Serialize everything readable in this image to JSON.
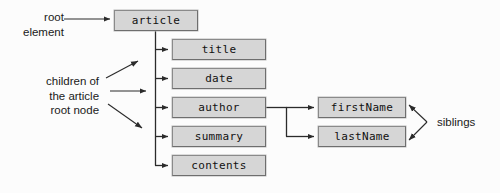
{
  "diagram": {
    "background_color": "#fcfcfc",
    "node_fill_color": "#d6d6d6",
    "node_border_color": "#8a8a8a",
    "connector_color": "#2b2b2b",
    "text_color": "#111111"
  },
  "nodes": {
    "root": {
      "label": "article",
      "x": 114,
      "y": 10,
      "width": 84,
      "height": 21
    },
    "children": [
      {
        "label": "title",
        "x": 172,
        "y": 39,
        "width": 94,
        "height": 21
      },
      {
        "label": "date",
        "x": 172,
        "y": 68,
        "width": 94,
        "height": 21
      },
      {
        "label": "author",
        "x": 172,
        "y": 97,
        "width": 94,
        "height": 21
      },
      {
        "label": "summary",
        "x": 172,
        "y": 126,
        "width": 94,
        "height": 21
      },
      {
        "label": "contents",
        "x": 172,
        "y": 155,
        "width": 94,
        "height": 21
      }
    ],
    "grandchildren": [
      {
        "label": "firstName",
        "x": 318,
        "y": 97,
        "width": 88,
        "height": 21
      },
      {
        "label": "lastName",
        "x": 318,
        "y": 126,
        "width": 88,
        "height": 21
      }
    ]
  },
  "annotations": {
    "root_element": {
      "lines": [
        "root",
        "element"
      ],
      "text": "root\nelement",
      "x": 23,
      "y": 10
    },
    "children_of_article": {
      "lines": [
        "children of",
        "the article",
        "root node"
      ],
      "text": "children of\nthe article\nroot node",
      "x": 46,
      "y": 74
    },
    "siblings": {
      "text": "siblings",
      "x": 437,
      "y": 115
    }
  }
}
